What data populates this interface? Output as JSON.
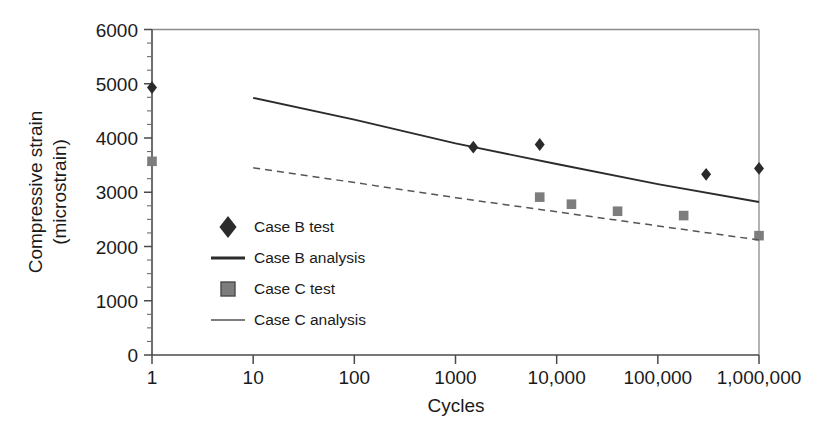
{
  "chart_data": {
    "type": "scatter",
    "title": "",
    "xlabel": "Cycles",
    "ylabel": "Compressive strain (microstrain)",
    "ylabel_line1": "Compressive strain",
    "ylabel_line2": "(microstrain)",
    "xscale": "log",
    "yscale": "linear",
    "xlim": [
      1,
      1000000
    ],
    "ylim": [
      0,
      6000
    ],
    "grid": false,
    "legend_position": "inside-lower-left",
    "xticks": [
      1,
      10,
      100,
      1000,
      10000,
      100000,
      1000000
    ],
    "xticklabels": [
      "1",
      "10",
      "100",
      "1000",
      "10,000",
      "100,000",
      "1,000,000"
    ],
    "yticks": [
      0,
      1000,
      2000,
      3000,
      4000,
      5000,
      6000
    ],
    "yticklabels": [
      "0",
      "1000",
      "2000",
      "3000",
      "4000",
      "5000",
      "6000"
    ],
    "y_minor_tick_interval": 250,
    "series": [
      {
        "name": "Case B test",
        "type": "scatter",
        "marker": "diamond",
        "color": "#2b2b2b",
        "points": [
          {
            "x": 1,
            "y": 4930
          },
          {
            "x": 1500,
            "y": 3830
          },
          {
            "x": 6800,
            "y": 3880
          },
          {
            "x": 300000,
            "y": 3330
          },
          {
            "x": 1000000,
            "y": 3440
          }
        ]
      },
      {
        "name": "Case B analysis",
        "type": "line",
        "linestyle": "solid",
        "color": "#2b2b2b",
        "width": 1.9,
        "points": [
          {
            "x": 10,
            "y": 4740
          },
          {
            "x": 100,
            "y": 4340
          },
          {
            "x": 1000,
            "y": 3900
          },
          {
            "x": 10000,
            "y": 3520
          },
          {
            "x": 100000,
            "y": 3150
          },
          {
            "x": 1000000,
            "y": 2820
          }
        ]
      },
      {
        "name": "Case C test",
        "type": "scatter",
        "marker": "square",
        "color": "#7d7d7d",
        "points": [
          {
            "x": 1,
            "y": 3570
          },
          {
            "x": 6800,
            "y": 2910
          },
          {
            "x": 14000,
            "y": 2780
          },
          {
            "x": 40000,
            "y": 2650
          },
          {
            "x": 180000,
            "y": 2570
          },
          {
            "x": 1000000,
            "y": 2200
          }
        ]
      },
      {
        "name": "Case C analysis",
        "type": "line",
        "linestyle": "dashed",
        "color": "#555555",
        "width": 1.5,
        "points": [
          {
            "x": 10,
            "y": 3450
          },
          {
            "x": 100,
            "y": 3180
          },
          {
            "x": 1000,
            "y": 2900
          },
          {
            "x": 10000,
            "y": 2640
          },
          {
            "x": 100000,
            "y": 2380
          },
          {
            "x": 1000000,
            "y": 2120
          }
        ]
      }
    ],
    "legend": [
      {
        "label": "Case B test",
        "marker": "diamond",
        "color": "#2b2b2b"
      },
      {
        "label": "Case B analysis",
        "marker": "line-solid-dark",
        "color": "#2b2b2b"
      },
      {
        "label": "Case C test",
        "marker": "square",
        "color": "#7d7d7d"
      },
      {
        "label": "Case C analysis",
        "marker": "line-solid-gray",
        "color": "#7d7d7d"
      }
    ]
  },
  "colors": {
    "case_b": "#2b2b2b",
    "case_c": "#7d7d7d",
    "axis": "#4a4a4a",
    "frame": "#8a8a8a",
    "background": "#ffffff"
  }
}
